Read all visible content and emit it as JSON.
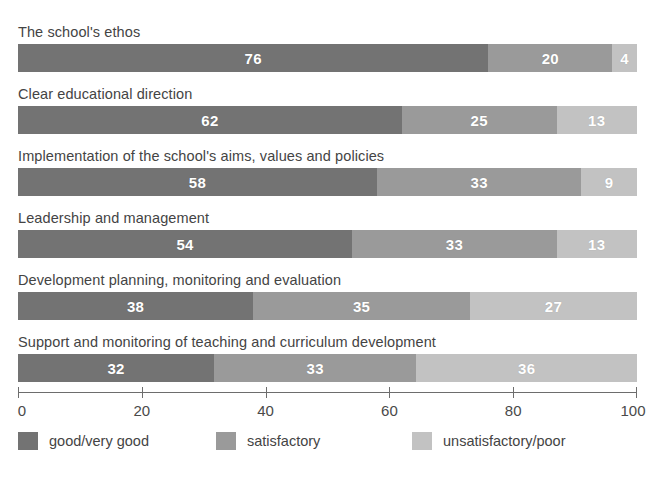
{
  "chart_data": {
    "type": "bar",
    "orientation": "horizontal",
    "stacked": true,
    "title": "",
    "subtitle": "",
    "xlabel": "",
    "ylabel": "",
    "xlim": [
      0,
      100
    ],
    "ylim": null,
    "grid": false,
    "legend_position": "bottom",
    "axis_ticks": [
      "0",
      "20",
      "40",
      "60",
      "80",
      "100"
    ],
    "axis_tick_values": [
      0,
      20,
      40,
      60,
      80,
      100
    ],
    "categories": [
      "The school's ethos",
      "Clear educational direction",
      "Implementation of the school's aims, values and policies",
      "Leadership and management",
      "Development planning, monitoring and evaluation",
      "Support and monitoring of teaching and curriculum development"
    ],
    "series": [
      {
        "name": "good/very good",
        "color": "#737373",
        "values": [
          76,
          62,
          58,
          54,
          38,
          32
        ]
      },
      {
        "name": "satisfactory",
        "color": "#9a9a9a",
        "values": [
          20,
          25,
          33,
          33,
          35,
          33
        ]
      },
      {
        "name": "unsatisfactory/poor",
        "color": "#c2c2c2",
        "values": [
          4,
          13,
          9,
          13,
          27,
          36
        ]
      }
    ],
    "rows": [
      {
        "label": "The school's ethos",
        "segments": [
          76,
          20,
          4
        ]
      },
      {
        "label": "Clear educational direction",
        "segments": [
          62,
          25,
          13
        ]
      },
      {
        "label": "Implementation of the school's aims, values and policies",
        "segments": [
          58,
          33,
          9
        ]
      },
      {
        "label": "Leadership and management",
        "segments": [
          54,
          33,
          13
        ]
      },
      {
        "label": "Development planning, monitoring and evaluation",
        "segments": [
          38,
          35,
          27
        ]
      },
      {
        "label": "Support and monitoring of teaching and curriculum development",
        "segments": [
          32,
          33,
          36
        ]
      }
    ]
  },
  "legend": {
    "items": [
      {
        "label": "good/very good",
        "color": "#737373"
      },
      {
        "label": "satisfactory",
        "color": "#9a9a9a"
      },
      {
        "label": "unsatisfactory/poor",
        "color": "#c2c2c2"
      }
    ]
  },
  "colors": {
    "background": "#ffffff",
    "axis": "#6d6d6d",
    "label_text": "#444444",
    "value_text": "#ffffff",
    "good": "#737373",
    "satisfactory": "#9a9a9a",
    "unsatisfactory": "#c2c2c2"
  }
}
